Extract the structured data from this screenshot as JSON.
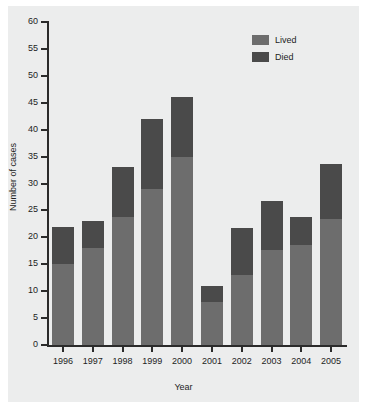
{
  "figure": {
    "background_color": "#ffffff",
    "panel_color": "#eceded"
  },
  "legend": {
    "position": "top-right",
    "entries": [
      {
        "label": "Lived",
        "color": "#6d6d6d",
        "swatch_name": "lived-swatch"
      },
      {
        "label": "Died",
        "color": "#4a4a4a",
        "swatch_name": "died-swatch"
      }
    ]
  },
  "chart_data": {
    "type": "bar",
    "subtype": "stacked-vertical",
    "title": "",
    "subtitle": "",
    "xlabel": "Year",
    "ylabel": "Number of cases",
    "categories": [
      "1996",
      "1997",
      "1998",
      "1999",
      "2000",
      "2001",
      "2002",
      "2003",
      "2004",
      "2005"
    ],
    "series": [
      {
        "name": "Lived",
        "color": "#6d6d6d",
        "values": [
          15,
          18,
          23.8,
          29,
          35,
          8,
          13,
          17.7,
          18.6,
          23.5
        ]
      },
      {
        "name": "Died",
        "color": "#4a4a4a",
        "values": [
          7,
          5,
          9.2,
          13,
          11,
          3,
          8.7,
          9.1,
          5.1,
          10.1
        ]
      }
    ],
    "totals": [
      22,
      23,
      33,
      42,
      46,
      11,
      21.7,
      26.8,
      23.7,
      33.6
    ],
    "ylim": [
      0,
      60
    ],
    "yticks": [
      0,
      5,
      10,
      15,
      20,
      25,
      30,
      35,
      40,
      45,
      50,
      55,
      60
    ],
    "ytick_labels": [
      "0",
      "5",
      "10",
      "15",
      "20",
      "25",
      "30",
      "35",
      "40",
      "45",
      "50",
      "55",
      "60"
    ],
    "grid": false,
    "legend_position": "top-right"
  }
}
